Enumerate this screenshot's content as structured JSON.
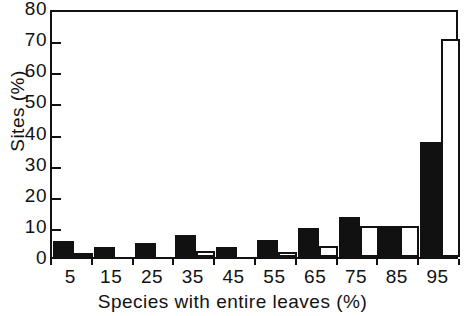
{
  "chart_data": {
    "type": "bar",
    "title": "",
    "subtitle": "",
    "xlabel": "Species with entire leaves (%)",
    "ylabel": "Sites (%)",
    "categories": [
      "5",
      "15",
      "25",
      "35",
      "45",
      "55",
      "65",
      "75",
      "85",
      "95"
    ],
    "series": [
      {
        "name": "solid",
        "style": "filled-black",
        "color": "#111111",
        "values": [
          5.0,
          3.3,
          4.5,
          7.0,
          3.2,
          5.5,
          9.3,
          13.0,
          10.0,
          37.0
        ]
      },
      {
        "name": "open",
        "style": "open-outline",
        "color": "#ffffff",
        "edge_color": "#111111",
        "values": [
          1.3,
          0.0,
          0.0,
          1.8,
          0.0,
          1.5,
          3.5,
          10.0,
          10.0,
          70.0
        ]
      }
    ],
    "ylim": [
      0,
      80
    ],
    "yticks": [
      0,
      10,
      20,
      30,
      40,
      50,
      60,
      70,
      80
    ],
    "ytick_labels": [
      "0",
      "10",
      "20",
      "30",
      "40",
      "50",
      "60",
      "70",
      "80"
    ],
    "xtick_labels": [
      "5",
      "15",
      "25",
      "35",
      "45",
      "55",
      "65",
      "75",
      "85",
      "95"
    ],
    "grid": false,
    "legend": "none",
    "frame": "box"
  }
}
